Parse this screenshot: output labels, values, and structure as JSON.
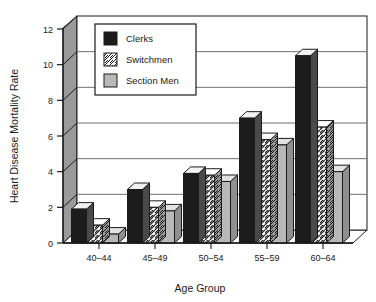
{
  "chart_data": {
    "type": "bar",
    "title": "",
    "subtitle": "",
    "xlabel": "Age  Group",
    "ylabel": "Heart Disease Mortality Rate",
    "categories": [
      "40–44",
      "45–49",
      "50–54",
      "55–59",
      "60–64"
    ],
    "series": [
      {
        "name": "Clerks",
        "values": [
          1.9,
          3.0,
          3.9,
          7.0,
          10.5
        ],
        "fill": "#1c1c1c",
        "pattern": "solid-black"
      },
      {
        "name": "Switchmen",
        "values": [
          1.0,
          2.0,
          3.8,
          5.8,
          6.5
        ],
        "fill": "#ffffff",
        "pattern": "diagonal-hatch"
      },
      {
        "name": "Section Men",
        "values": [
          0.5,
          1.8,
          3.45,
          5.5,
          4.0
        ],
        "fill": "#b8b8b8",
        "pattern": "solid-gray"
      }
    ],
    "ylim": [
      0,
      12
    ],
    "yticks": [
      0,
      2,
      4,
      6,
      8,
      10,
      12
    ],
    "ytick_labels": [
      "0",
      "2",
      "4",
      "6",
      "8",
      "10",
      "12"
    ],
    "grid": "horizontal",
    "legend_position": "top-left-inside",
    "style": "3d-bars",
    "colors": {
      "clerks": "#1c1c1c",
      "switchmen": "#ffffff",
      "section_men": "#b8b8b8",
      "bar_top": "#f2f2f2",
      "bar_side": "#808080",
      "wall": "#9a9a9a",
      "grid_line": "#6f6f6f",
      "axis_line": "#1a1a1a",
      "background": "#ffffff"
    }
  },
  "legend": {
    "entries": [
      {
        "label": "Clerks",
        "swatch": "solid-black-swatch"
      },
      {
        "label": "Switchmen",
        "swatch": "hatched-swatch"
      },
      {
        "label": "Section Men",
        "swatch": "solid-gray-swatch"
      }
    ]
  },
  "axes": {
    "y_title": "Heart Disease Mortality Rate",
    "x_title": "Age  Group",
    "y_tick_labels": [
      "0",
      "2",
      "4",
      "6",
      "8",
      "10",
      "12"
    ],
    "x_tick_labels": [
      "40–44",
      "45–49",
      "50–54",
      "55–59",
      "60–64"
    ]
  }
}
